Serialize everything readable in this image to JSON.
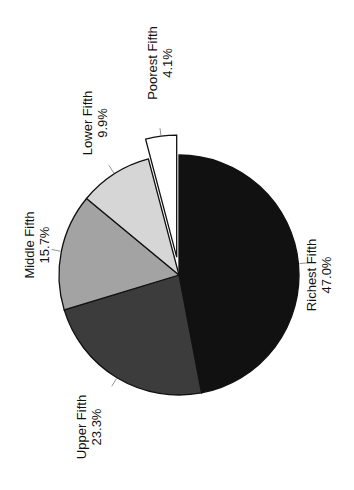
{
  "chart_data": {
    "type": "pie",
    "title": "",
    "orientation": "rotated -90deg (labels read bottom-to-top)",
    "slices": [
      {
        "label": "Richest Fifth",
        "value": 47.0,
        "display": "47.0%",
        "color": "#111111",
        "exploded": false
      },
      {
        "label": "Upper Fifth",
        "value": 23.3,
        "display": "23.3%",
        "color": "#3c3c3c",
        "exploded": false
      },
      {
        "label": "Middle Fifth",
        "value": 15.7,
        "display": "15.7%",
        "color": "#a3a3a3",
        "exploded": false
      },
      {
        "label": "Lower Fifth",
        "value": 9.9,
        "display": "9.9%",
        "color": "#d6d6d6",
        "exploded": false
      },
      {
        "label": "Poorest Fifth",
        "value": 4.1,
        "display": "4.1%",
        "color": "#ffffff",
        "exploded": true
      }
    ],
    "categories": [
      "Richest Fifth",
      "Upper Fifth",
      "Middle Fifth",
      "Lower Fifth",
      "Poorest Fifth"
    ],
    "values": [
      47.0,
      23.3,
      15.7,
      9.9,
      4.1
    ],
    "legend": "none (direct labels)"
  }
}
